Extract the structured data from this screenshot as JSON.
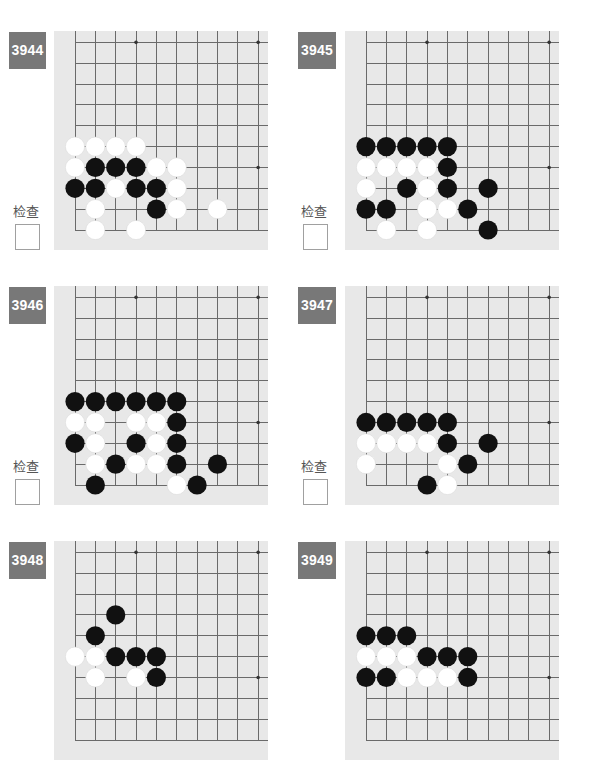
{
  "colors": {
    "page_bg": "#ffffff",
    "badge_bg": "#787878",
    "badge_text": "#ffffff",
    "board_bg": "#e8e8e8",
    "grid_line": "#6a6a6a",
    "star_point": "#333333",
    "black_stone": "#111111",
    "white_stone": "#ffffff",
    "check_label": "#555555",
    "checkbox_border": "#a0a0a0"
  },
  "board_view": {
    "visible_lines": 10,
    "coordinate_origin": "bottom-left corner, [col,row]",
    "star_points": [
      [
        3,
        3
      ],
      [
        3,
        9
      ],
      [
        9,
        3
      ],
      [
        9,
        9
      ]
    ]
  },
  "problems": [
    {
      "number": "3944",
      "check_label": "检查",
      "checked": false,
      "black": [
        [
          1,
          3
        ],
        [
          2,
          3
        ],
        [
          3,
          3
        ],
        [
          0,
          2
        ],
        [
          1,
          2
        ],
        [
          3,
          2
        ],
        [
          4,
          2
        ],
        [
          4,
          1
        ]
      ],
      "white": [
        [
          0,
          4
        ],
        [
          1,
          4
        ],
        [
          2,
          4
        ],
        [
          3,
          4
        ],
        [
          0,
          3
        ],
        [
          4,
          3
        ],
        [
          5,
          3
        ],
        [
          2,
          2
        ],
        [
          5,
          2
        ],
        [
          1,
          1
        ],
        [
          5,
          1
        ],
        [
          7,
          1
        ],
        [
          1,
          0
        ],
        [
          3,
          0
        ]
      ]
    },
    {
      "number": "3945",
      "check_label": "检查",
      "checked": false,
      "black": [
        [
          0,
          4
        ],
        [
          1,
          4
        ],
        [
          2,
          4
        ],
        [
          3,
          4
        ],
        [
          4,
          4
        ],
        [
          4,
          3
        ],
        [
          2,
          2
        ],
        [
          4,
          2
        ],
        [
          6,
          2
        ],
        [
          0,
          1
        ],
        [
          1,
          1
        ],
        [
          5,
          1
        ],
        [
          6,
          0
        ]
      ],
      "white": [
        [
          0,
          3
        ],
        [
          1,
          3
        ],
        [
          2,
          3
        ],
        [
          3,
          3
        ],
        [
          0,
          2
        ],
        [
          3,
          2
        ],
        [
          3,
          1
        ],
        [
          4,
          1
        ],
        [
          1,
          0
        ],
        [
          3,
          0
        ]
      ]
    },
    {
      "number": "3946",
      "check_label": "检查",
      "checked": false,
      "black": [
        [
          0,
          4
        ],
        [
          1,
          4
        ],
        [
          2,
          4
        ],
        [
          3,
          4
        ],
        [
          4,
          4
        ],
        [
          5,
          4
        ],
        [
          5,
          3
        ],
        [
          0,
          2
        ],
        [
          3,
          2
        ],
        [
          5,
          2
        ],
        [
          2,
          1
        ],
        [
          5,
          1
        ],
        [
          7,
          1
        ],
        [
          1,
          0
        ],
        [
          6,
          0
        ]
      ],
      "white": [
        [
          0,
          3
        ],
        [
          1,
          3
        ],
        [
          3,
          3
        ],
        [
          4,
          3
        ],
        [
          1,
          2
        ],
        [
          4,
          2
        ],
        [
          1,
          1
        ],
        [
          3,
          1
        ],
        [
          4,
          1
        ],
        [
          5,
          0
        ]
      ]
    },
    {
      "number": "3947",
      "check_label": "检查",
      "checked": false,
      "black": [
        [
          0,
          3
        ],
        [
          1,
          3
        ],
        [
          2,
          3
        ],
        [
          3,
          3
        ],
        [
          4,
          3
        ],
        [
          4,
          2
        ],
        [
          6,
          2
        ],
        [
          5,
          1
        ],
        [
          3,
          0
        ]
      ],
      "white": [
        [
          0,
          2
        ],
        [
          1,
          2
        ],
        [
          2,
          2
        ],
        [
          3,
          2
        ],
        [
          0,
          1
        ],
        [
          4,
          1
        ],
        [
          4,
          0
        ]
      ]
    },
    {
      "number": "3948",
      "black": [
        [
          2,
          6
        ],
        [
          1,
          5
        ],
        [
          2,
          4
        ],
        [
          3,
          4
        ],
        [
          4,
          4
        ],
        [
          4,
          3
        ]
      ],
      "white": [
        [
          0,
          4
        ],
        [
          1,
          4
        ],
        [
          1,
          3
        ],
        [
          3,
          3
        ]
      ]
    },
    {
      "number": "3949",
      "black": [
        [
          0,
          5
        ],
        [
          1,
          5
        ],
        [
          2,
          5
        ],
        [
          3,
          4
        ],
        [
          4,
          4
        ],
        [
          5,
          4
        ],
        [
          0,
          3
        ],
        [
          1,
          3
        ],
        [
          5,
          3
        ]
      ],
      "white": [
        [
          0,
          4
        ],
        [
          1,
          4
        ],
        [
          2,
          4
        ],
        [
          2,
          3
        ],
        [
          3,
          3
        ],
        [
          4,
          3
        ]
      ]
    }
  ]
}
